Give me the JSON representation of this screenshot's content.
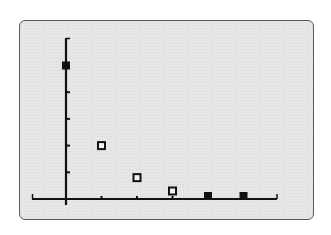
{
  "chart_data": {
    "type": "scatter",
    "title": "",
    "xlabel": "",
    "ylabel": "",
    "x": [
      0,
      1,
      2,
      3,
      4,
      5
    ],
    "values": [
      5,
      2,
      0.8,
      0.3,
      0.1,
      0.05
    ],
    "series": [
      {
        "name": "data",
        "x": [
          0,
          1,
          2,
          3,
          4,
          5
        ],
        "values": [
          5,
          2,
          0.8,
          0.3,
          0.1,
          0.05
        ]
      }
    ],
    "xlim": [
      -1,
      6
    ],
    "ylim": [
      0,
      6
    ],
    "x_ticks": [
      0,
      1,
      2,
      3,
      4,
      5,
      6
    ],
    "y_ticks": [
      1,
      2,
      3,
      4,
      5,
      6
    ],
    "grid": false,
    "legend": "none",
    "marker": "square",
    "axis_color": "#111111",
    "screen_color": "#e6e6e6"
  }
}
